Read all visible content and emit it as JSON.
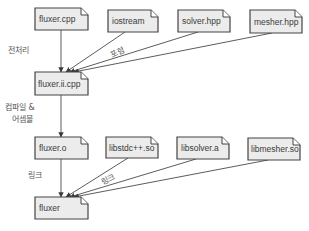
{
  "diagram": {
    "title": "",
    "nodes": {
      "fluxer_cpp": {
        "label": "fluxer.cpp",
        "x": 35,
        "y": 8,
        "w": 53,
        "h": 22
      },
      "iostream": {
        "label": "iostream",
        "x": 108,
        "y": 10,
        "w": 50,
        "h": 22
      },
      "solver_hpp": {
        "label": "solver.hpp",
        "x": 178,
        "y": 10,
        "w": 52,
        "h": 22
      },
      "mesher_hpp": {
        "label": "mesher.hpp",
        "x": 250,
        "y": 10,
        "w": 52,
        "h": 23
      },
      "fluxer_ii_cpp": {
        "label": "fluxer.ii.cpp",
        "x": 35,
        "y": 72,
        "w": 53,
        "h": 23
      },
      "fluxer_o": {
        "label": "fluxer.o",
        "x": 35,
        "y": 137,
        "w": 53,
        "h": 22
      },
      "libstdcpp_so": {
        "label": "libstdc++.so",
        "x": 106,
        "y": 137,
        "w": 52,
        "h": 21
      },
      "libsolver_a": {
        "label": "libsolver.a",
        "x": 177,
        "y": 137,
        "w": 52,
        "h": 22
      },
      "libmesher_so": {
        "label": "libmesher.so",
        "x": 248,
        "y": 138,
        "w": 52,
        "h": 22
      },
      "fluxer": {
        "label": "fluxer",
        "x": 35,
        "y": 197,
        "w": 53,
        "h": 22
      }
    },
    "edges": [
      {
        "from": "fluxer_cpp",
        "to": "fluxer_ii_cpp",
        "label": "전처리"
      },
      {
        "from": "iostream",
        "to": "fluxer_ii_cpp",
        "label": "포함"
      },
      {
        "from": "solver_hpp",
        "to": "fluxer_ii_cpp",
        "label": ""
      },
      {
        "from": "mesher_hpp",
        "to": "fluxer_ii_cpp",
        "label": ""
      },
      {
        "from": "fluxer_ii_cpp",
        "to": "fluxer_o",
        "label": "컴파일 & 어셈블"
      },
      {
        "from": "fluxer_o",
        "to": "fluxer",
        "label": "링크"
      },
      {
        "from": "libstdcpp_so",
        "to": "fluxer",
        "label": "링크"
      },
      {
        "from": "libsolver_a",
        "to": "fluxer",
        "label": ""
      },
      {
        "from": "libmesher_so",
        "to": "fluxer",
        "label": ""
      }
    ],
    "edge_labels": {
      "preprocess": "전처리",
      "include": "포함",
      "compile_line1": "컴파일 &",
      "compile_line2": "어셈블",
      "link_left": "링크",
      "link_diag": "링크"
    },
    "colors": {
      "node_fill": "#ececec",
      "node_stroke": "#444444",
      "edge": "#4a4a4a",
      "text": "#3a3a3a",
      "background": "#ffffff"
    }
  }
}
